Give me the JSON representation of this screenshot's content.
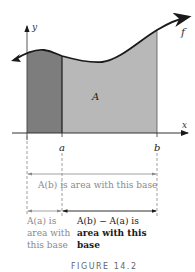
{
  "figure": {
    "caption": "FIGURE 14.2",
    "axes": {
      "x_label": "x",
      "y_label": "y"
    },
    "curve_label": "f",
    "region_label": "A",
    "points": {
      "a_label": "a",
      "b_label": "b"
    },
    "annotations": {
      "ab_full": "A(b) is area with this base",
      "aa_line1": "A(a) is",
      "aa_line2": "area with",
      "aa_line3": "this base",
      "diff_line1": "A(b) − A(a) is",
      "diff_line2": "area with this",
      "diff_line3": "base"
    },
    "colors": {
      "dark_region": "#7a7a7a",
      "light_region": "#b5b5b5",
      "curve": "#1a1a1a",
      "gray_text": "#8a8a8a",
      "black_text": "#1a1a1a"
    }
  }
}
